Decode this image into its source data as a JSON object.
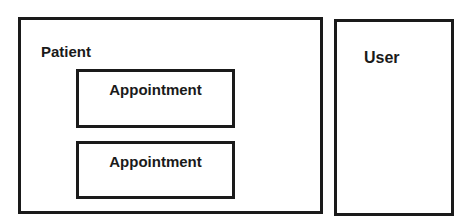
{
  "diagram": {
    "patient": {
      "label": "Patient",
      "children": [
        {
          "label": "Appointment"
        },
        {
          "label": "Appointment"
        }
      ]
    },
    "user": {
      "label": "User"
    }
  },
  "colors": {
    "stroke": "#1a1a1a",
    "background": "#ffffff"
  }
}
